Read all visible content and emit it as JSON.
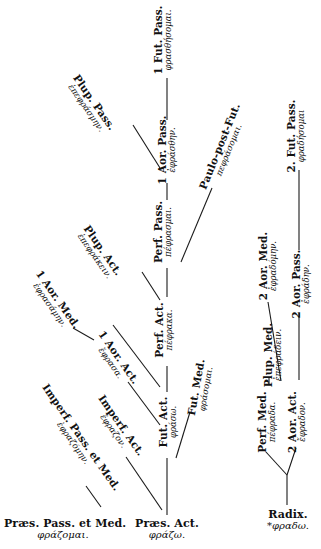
{
  "diagram": {
    "roots": [
      {
        "id": "praes-pass-med",
        "tense": "Præs. Pass. et Med.",
        "form": "φράζομαι."
      },
      {
        "id": "praes-act",
        "tense": "Præs. Act.",
        "form": "φράζω."
      },
      {
        "id": "radix",
        "tense": "Radix.",
        "form": "*φραδω."
      }
    ],
    "nodes": {
      "impf_pass_med": {
        "tense": "Imperf. Pass. et Med.",
        "form": "ἐφραζόμην."
      },
      "impf_act": {
        "tense": "Imperf. Act.",
        "form": "ἔφραζον."
      },
      "aor1_act": {
        "tense": "1 Aor. Act.",
        "form": "ἔφρασα."
      },
      "aor1_med": {
        "tense": "1 Aor. Med.",
        "form": "ἐφρασάμην."
      },
      "plup_act": {
        "tense": "Plup. Act.",
        "form": "ἐπεφράκειν."
      },
      "plup_pass": {
        "tense": "Plup. Pass.",
        "form": "ἐπεφράσμην."
      },
      "fut_act": {
        "tense": "Fut. Act.",
        "form": "φράσω."
      },
      "fut_med": {
        "tense": "Fut. Med.",
        "form": "φράσομαι."
      },
      "perf_act": {
        "tense": "Perf. Act.",
        "form": "πέφρακα."
      },
      "perf_pass": {
        "tense": "Perf. Pass.",
        "form": "πέφρασμαι."
      },
      "paulo_post_fut": {
        "tense": "Paulo-post-Fut.",
        "form": "πεφράσομαι."
      },
      "aor1_pass": {
        "tense": "1 Aor. Pass.",
        "form": "ἐφράσθην."
      },
      "fut1_pass": {
        "tense": "1 Fut. Pass.",
        "form": "φρασθήσομαι."
      },
      "perf_med": {
        "tense": "Perf. Med.",
        "form": "πέφραδα."
      },
      "plup_med": {
        "tense": "Plup. Med.",
        "form": "ἐπεφράδειν."
      },
      "aor2_act": {
        "tense": "2 Aor. Act.",
        "form": "ἔφραδον."
      },
      "aor2_med": {
        "tense": "2 Aor. Med.",
        "form": "ἐφραδόμην."
      },
      "aor2_pass": {
        "tense": "2 Aor. Pass.",
        "form": "ἐφράδην."
      },
      "fut2_pass": {
        "tense": "2. Fut. Pass.",
        "form": "φραδήσομαι"
      }
    },
    "colors": {
      "ink": "#1a1a1a",
      "paper": "#ffffff"
    }
  }
}
